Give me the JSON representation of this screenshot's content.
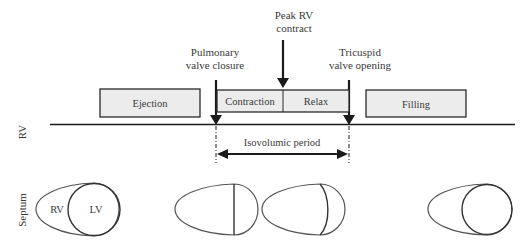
{
  "events": {
    "peak_rv": {
      "line1": "Peak RV",
      "line2": "contract"
    },
    "pulmonary": {
      "line1": "Pulmonary",
      "line2": "valve closure"
    },
    "tricuspid": {
      "line1": "Tricuspid",
      "line2": "valve opening"
    }
  },
  "phases": {
    "ejection": "Ejection",
    "contraction": "Contraction",
    "relax": "Relax",
    "filling": "Filling"
  },
  "timeline": {
    "row_label": "RV",
    "period_label": "Isovolumic period"
  },
  "septum": {
    "row_label": "Septum",
    "rv_label": "RV",
    "lv_label": "LV"
  },
  "colors": {
    "box_fill": "#ececec",
    "stroke": "#2a2a2a",
    "outline": "#555555"
  }
}
